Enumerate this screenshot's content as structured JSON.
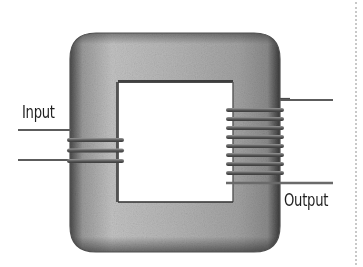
{
  "diagram": {
    "labels": {
      "input": "Input",
      "output": "Output"
    },
    "core": {
      "outer": {
        "x": 70,
        "y": 33,
        "width": 210,
        "height": 219,
        "radius": 26
      },
      "window": {
        "x": 118,
        "y": 82,
        "width": 115,
        "height": 120
      },
      "colors": {
        "fill": "#a9a9a9",
        "highlight": "#c6c6c6",
        "edge": "#4a4a4a"
      }
    },
    "primary_winding": {
      "side": "left",
      "turns": 3,
      "turn_y": [
        140,
        150.5,
        161
      ],
      "lead_y": [
        130,
        160
      ],
      "lead_x_start": 18
    },
    "secondary_winding": {
      "side": "right",
      "turns": 8,
      "turn_y": [
        110,
        119,
        128,
        137,
        146,
        155,
        164,
        173
      ],
      "lead_y": [
        100,
        183
      ],
      "lead_x_end": 333
    },
    "wire_color": "#6a6a6a"
  }
}
